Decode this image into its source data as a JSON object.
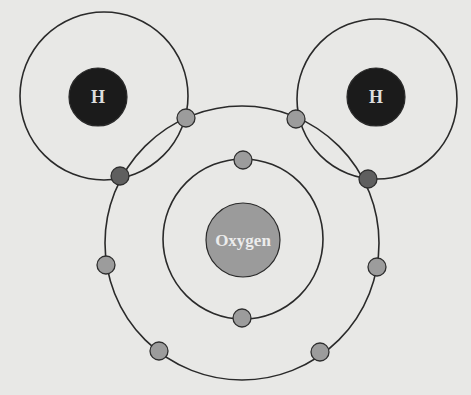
{
  "diagram": {
    "background": "#e8e8e6",
    "colors": {
      "orbit_stroke": "#2a2a2a",
      "hydrogen_nucleus": "#1b1b1b",
      "hydrogen_label": "#dedede",
      "oxygen_nucleus": "#9b9b9b",
      "oxygen_label": "#ececec",
      "electron": "#9c9c9c",
      "shared_electron": "#5f5f5f"
    },
    "atoms": [
      {
        "id": "hydrogen-left",
        "label": "H",
        "nucleus": {
          "cx": 98,
          "cy": 97,
          "r": 29
        },
        "shell": {
          "cx": 104,
          "cy": 96,
          "r": 84
        }
      },
      {
        "id": "hydrogen-right",
        "label": "H",
        "nucleus": {
          "cx": 376,
          "cy": 97,
          "r": 29
        },
        "shell": {
          "cx": 377,
          "cy": 99,
          "r": 80
        }
      },
      {
        "id": "oxygen",
        "label": "Oxygen",
        "nucleus": {
          "cx": 243,
          "cy": 240,
          "r": 37
        },
        "shells": [
          {
            "name": "inner",
            "cx": 243,
            "cy": 239,
            "r": 80
          },
          {
            "name": "outer",
            "cx": 242,
            "cy": 243,
            "r": 137
          }
        ]
      }
    ],
    "electrons": [
      {
        "shell": "oxygen-inner",
        "cx": 243,
        "cy": 160,
        "shared": false
      },
      {
        "shell": "oxygen-inner",
        "cx": 242,
        "cy": 318,
        "shared": false
      },
      {
        "shell": "oxygen-outer",
        "cx": 186,
        "cy": 118,
        "shared": false
      },
      {
        "shell": "oxygen-outer",
        "cx": 296,
        "cy": 119,
        "shared": false
      },
      {
        "shell": "oxygen-outer",
        "cx": 106,
        "cy": 265,
        "shared": false
      },
      {
        "shell": "oxygen-outer",
        "cx": 377,
        "cy": 267,
        "shared": false
      },
      {
        "shell": "oxygen-outer",
        "cx": 159,
        "cy": 351,
        "shared": false
      },
      {
        "shell": "oxygen-outer",
        "cx": 320,
        "cy": 352,
        "shared": false
      },
      {
        "shell": "bond-left",
        "cx": 120,
        "cy": 176,
        "shared": true
      },
      {
        "shell": "bond-right",
        "cx": 368,
        "cy": 179,
        "shared": true
      }
    ],
    "electron_radius": 9
  }
}
